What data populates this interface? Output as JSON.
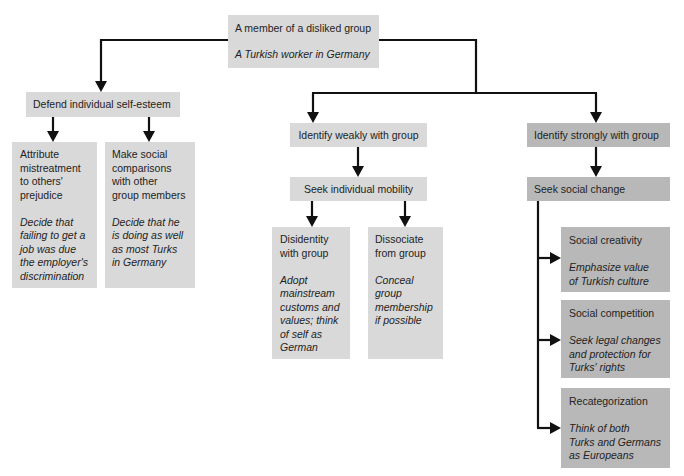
{
  "colors": {
    "light_box": "#d9d9d9",
    "dark_box": "#b8b8b8",
    "ink": "#111111",
    "text": "#232323"
  },
  "diagram": {
    "root": {
      "title": "A member of a disliked group",
      "example": "A Turkish worker in Germany"
    },
    "defend": {
      "label": "Defend individual self-esteem",
      "children": [
        {
          "title": "Attribute\nmistreatment\nto others'\nprejudice",
          "example": "Decide that\nfailing to get a\njob was due\nthe employer's\ndiscrimination"
        },
        {
          "title": "Make social\ncomparisons\nwith other\ngroup members",
          "example": "Decide that he\nis doing as well\nas most Turks\nin Germany"
        }
      ]
    },
    "weak": {
      "label": "Identify weakly with group",
      "next": {
        "label": "Seek individual mobility",
        "children": [
          {
            "title": "Disidentity\nwith group",
            "example": "Adopt\nmainstream\ncustoms and\nvalues; think\nof self as\nGerman"
          },
          {
            "title": "Dissociate\nfrom group",
            "example": "Conceal\ngroup\nmembership\nif possible"
          }
        ]
      }
    },
    "strong": {
      "label": "Identify strongly with group",
      "next": {
        "label": "Seek social change",
        "children": [
          {
            "title": "Social creativity",
            "example": "Emphasize value\nof Turkish culture"
          },
          {
            "title": "Social competition",
            "example": "Seek legal changes\nand protection for\nTurks' rights"
          },
          {
            "title": "Recategorization",
            "example": "Think of both\nTurks and Germans\nas Europeans"
          }
        ]
      }
    }
  },
  "edges": [
    [
      "A member of a disliked group",
      "Defend individual self-esteem"
    ],
    [
      "A member of a disliked group",
      "Identify weakly with group"
    ],
    [
      "A member of a disliked group",
      "Identify strongly with group"
    ],
    [
      "Defend individual self-esteem",
      "Attribute mistreatment to others' prejudice"
    ],
    [
      "Defend individual self-esteem",
      "Make social comparisons with other group members"
    ],
    [
      "Identify weakly with group",
      "Seek individual mobility"
    ],
    [
      "Seek individual mobility",
      "Disidentity with group"
    ],
    [
      "Seek individual mobility",
      "Dissociate from group"
    ],
    [
      "Identify strongly with group",
      "Seek social change"
    ],
    [
      "Seek social change",
      "Social creativity"
    ],
    [
      "Seek social change",
      "Social competition"
    ],
    [
      "Seek social change",
      "Recategorization"
    ]
  ]
}
